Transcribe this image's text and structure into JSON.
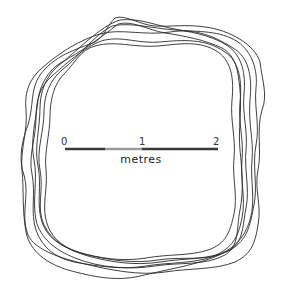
{
  "figure": {
    "loop_count": 7,
    "loop_color": "#2a2a2a",
    "background": "#ffffff"
  },
  "scale_bar": {
    "ticks": [
      {
        "label": "0",
        "x": 65
      },
      {
        "label": "1",
        "x": 142
      },
      {
        "label": "2",
        "x": 218
      }
    ],
    "unit": "metres",
    "segments": [
      {
        "from": 65,
        "to": 105,
        "color": "#3a3a3a"
      },
      {
        "from": 105,
        "to": 142,
        "color": "#9a9a9a"
      },
      {
        "from": 142,
        "to": 218,
        "color": "#3a3a3a"
      }
    ],
    "y": 149
  }
}
